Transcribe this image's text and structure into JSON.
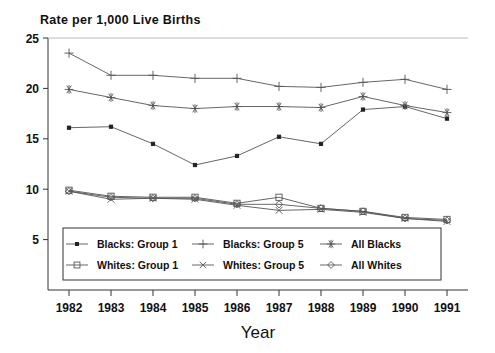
{
  "chart_data": {
    "type": "line",
    "title": "Rate per 1,000 Live Births",
    "xlabel": "Year",
    "ylabel": "",
    "x": [
      1982,
      1983,
      1984,
      1985,
      1986,
      1987,
      1988,
      1989,
      1990,
      1991
    ],
    "xtick_labels": [
      "1982",
      "1983",
      "1984",
      "1985",
      "1986",
      "1987",
      "1988",
      "1989",
      "1990",
      "1991"
    ],
    "ytick_labels": [
      "5",
      "10",
      "15",
      "20",
      "25"
    ],
    "yticks": [
      5,
      10,
      15,
      20,
      25
    ],
    "ylim": [
      0,
      25
    ],
    "xlim": [
      1981.5,
      1991.5
    ],
    "grid": false,
    "legend_position": "lower-center-inside",
    "series": [
      {
        "name": "Blacks: Group 1",
        "marker": "filled-square-small",
        "values": [
          16.1,
          16.2,
          14.5,
          12.4,
          13.3,
          15.2,
          14.5,
          17.9,
          18.2,
          17.0
        ]
      },
      {
        "name": "Blacks: Group 5",
        "marker": "plus",
        "values": [
          23.5,
          21.3,
          21.3,
          21.0,
          21.0,
          20.2,
          20.1,
          20.6,
          20.9,
          19.9
        ]
      },
      {
        "name": "All Blacks",
        "marker": "asterisk",
        "values": [
          19.9,
          19.1,
          18.3,
          18.0,
          18.2,
          18.2,
          18.1,
          19.2,
          18.3,
          17.6
        ]
      },
      {
        "name": "Whites: Group 1",
        "marker": "open-square",
        "values": [
          9.9,
          9.3,
          9.2,
          9.2,
          8.6,
          9.2,
          8.1,
          7.8,
          7.2,
          7.0
        ]
      },
      {
        "name": "Whites: Group 5",
        "marker": "x-cross",
        "values": [
          9.8,
          9.0,
          9.1,
          9.0,
          8.4,
          7.9,
          8.0,
          7.7,
          7.1,
          6.8
        ]
      },
      {
        "name": "All Whites",
        "marker": "diamond",
        "values": [
          9.8,
          9.2,
          9.1,
          9.1,
          8.5,
          8.5,
          8.1,
          7.8,
          7.1,
          6.9
        ]
      }
    ]
  },
  "legend": {
    "entries": [
      {
        "label": "Blacks: Group 1",
        "marker": "filled-square-small"
      },
      {
        "label": "Blacks: Group 5",
        "marker": "plus"
      },
      {
        "label": "All Blacks",
        "marker": "asterisk"
      },
      {
        "label": "Whites: Group 1",
        "marker": "open-square"
      },
      {
        "label": "Whites: Group 5",
        "marker": "x-cross"
      },
      {
        "label": "All Whites",
        "marker": "diamond"
      }
    ]
  },
  "colors": {
    "line": "#555555",
    "axis": "#333333",
    "text": "#111111",
    "background": "#ffffff"
  }
}
